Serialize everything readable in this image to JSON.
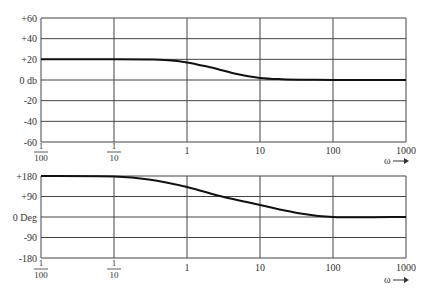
{
  "chart_data": [
    {
      "type": "line",
      "title": "",
      "name": "magnitude",
      "xlabel": "ω",
      "ylabel": "",
      "xscale": "log",
      "xlim": [
        0.01,
        1000
      ],
      "ylim": [
        -60,
        60
      ],
      "grid": true,
      "x_ticks": [
        0.01,
        0.1,
        1,
        10,
        100,
        1000
      ],
      "x_tick_labels": [
        "1/100",
        "1/10",
        "1",
        "10",
        "100",
        "1000"
      ],
      "y_ticks": [
        60,
        40,
        20,
        0,
        -20,
        -40,
        -60
      ],
      "y_tick_labels": [
        "+60",
        "+40",
        "+20",
        "0 db",
        "-20",
        "-40",
        "-60"
      ],
      "series": [
        {
          "name": "Magnitude (db)",
          "x": [
            0.01,
            0.1,
            0.3,
            0.5,
            1,
            2,
            3,
            5,
            10,
            20,
            50,
            100,
            1000
          ],
          "y": [
            20,
            20,
            19.8,
            19.3,
            17,
            12.5,
            9.5,
            5.5,
            2,
            0.8,
            0.2,
            0,
            0
          ]
        }
      ],
      "axis_label_text": "ω→"
    },
    {
      "type": "line",
      "title": "",
      "name": "phase",
      "xlabel": "ω",
      "ylabel": "",
      "xscale": "log",
      "xlim": [
        0.01,
        1000
      ],
      "ylim": [
        -180,
        180
      ],
      "grid": true,
      "x_ticks": [
        0.01,
        0.1,
        1,
        10,
        100,
        1000
      ],
      "x_tick_labels": [
        "1/100",
        "1/10",
        "1",
        "10",
        "100",
        "1000"
      ],
      "y_ticks": [
        180,
        90,
        0,
        -90,
        -180
      ],
      "y_tick_labels": [
        "+180",
        "+90",
        "0 Deg",
        "-90",
        "-180"
      ],
      "series": [
        {
          "name": "Phase (Deg)",
          "x": [
            0.01,
            0.1,
            0.3,
            1,
            3,
            10,
            30,
            100,
            1000
          ],
          "y": [
            180,
            178,
            165,
            132,
            90,
            53,
            20,
            0,
            0
          ]
        }
      ],
      "axis_label_text": "ω→"
    }
  ],
  "labels": {
    "mag_y": [
      "+60",
      "+40",
      "+20",
      "0 db",
      "-20",
      "-40",
      "-60"
    ],
    "phase_y": [
      "+180",
      "+90",
      "0 Deg",
      "-90",
      "-180"
    ],
    "x_int": [
      "1",
      "10",
      "100",
      "1000"
    ],
    "x_frac_num": "1",
    "x_frac_den": [
      "100",
      "10"
    ],
    "omega": "ω"
  }
}
